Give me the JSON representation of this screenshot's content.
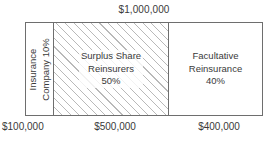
{
  "chart_data": {
    "type": "bar",
    "title": "$1,000,000",
    "subtitle": "",
    "xlabel": "",
    "ylabel": "",
    "orientation": "horizontal-stacked",
    "total_label": "$1,000,000",
    "total_value": 1000000,
    "categories": [
      "Insurance Company",
      "Surplus Share Reinsurers",
      "Facultative Reinsurance"
    ],
    "values": [
      100000,
      500000,
      400000
    ],
    "percentages": [
      10,
      50,
      40
    ],
    "value_labels": [
      "$100,000",
      "$500,000",
      "$400,000"
    ],
    "legend": [],
    "grid": false,
    "annotations": [
      "Insurance Company 10%",
      "Surplus Share Reinsurers 50%",
      "Facultative Reinsurance 40%"
    ]
  },
  "diagram": {
    "top_label": "$1,000,000",
    "segments": [
      {
        "name": "insurance-company",
        "line1": "Insurance",
        "line2": "Company 10%",
        "percent_label": "10%",
        "bottom_label": "$100,000",
        "fill": "solid-white",
        "rotated": true
      },
      {
        "name": "surplus-share-reinsurers",
        "line1": "Surplus Share",
        "line2": "Reinsurers",
        "line3": "50%",
        "percent_label": "50%",
        "bottom_label": "$500,000",
        "fill": "diagonal-hatch",
        "rotated": false
      },
      {
        "name": "facultative-reinsurance",
        "line1": "Facultative",
        "line2": "Reinsurance",
        "line3": "40%",
        "percent_label": "40%",
        "bottom_label": "$400,000",
        "fill": "solid-white",
        "rotated": false
      }
    ],
    "bottom_labels": [
      "$100,000",
      "$500,000",
      "$400,000"
    ],
    "colors": {
      "outline": "#6e6e6e",
      "hatch": "#b9b9b9",
      "text": "#3a3a3a",
      "background": "#ffffff"
    }
  }
}
